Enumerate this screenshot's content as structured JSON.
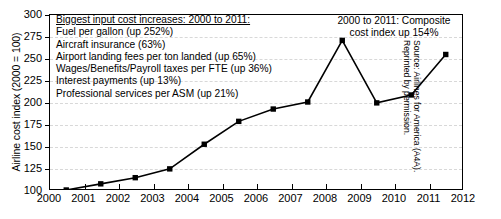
{
  "chart_data": {
    "type": "line",
    "title": "",
    "xlabel": "",
    "ylabel": "Airline cost index (2000 = 100)",
    "categories": [
      2000,
      2001,
      2002,
      2003,
      2004,
      2005,
      2006,
      2007,
      2008,
      2009,
      2010,
      2011
    ],
    "values": [
      100,
      107,
      114,
      124,
      152,
      178,
      192,
      200,
      270,
      199,
      208,
      254
    ],
    "series": [
      {
        "name": "Airline composite cost index",
        "values": [
          100,
          107,
          114,
          124,
          152,
          178,
          192,
          200,
          270,
          199,
          208,
          254
        ]
      }
    ],
    "x_tick_labels": [
      "2000",
      "2001",
      "2002",
      "2003",
      "2004",
      "2005",
      "2006",
      "2007",
      "2008",
      "2009",
      "2010",
      "2011",
      "2012"
    ],
    "y_tick_labels": [
      "100",
      "125",
      "150",
      "175",
      "200",
      "225",
      "250",
      "275",
      "300"
    ],
    "ylim": [
      100,
      300
    ],
    "xlim": [
      2000,
      2012
    ],
    "y_ticks": [
      100,
      125,
      150,
      175,
      200,
      225,
      250,
      275,
      300
    ],
    "grid": "horizontal-dashed",
    "legend": "none",
    "marker": "square",
    "line_color": "#000000",
    "marker_color": "#000000",
    "grid_color": "#d8d8d8",
    "annotations": [
      {
        "name": "cost-increase-list",
        "header": "Biggest input cost increases: 2000 to 2011:",
        "items": [
          "Fuel per gallon (up 252%)",
          "Aircraft insurance (63%)",
          "Airport landing fees per ton landed (up 65%)",
          "Wages/Benefits/Payroll taxes per FTE (up 36%)",
          "Interest payments (up 13%)",
          "Professional services per ASM (up 21%)"
        ]
      },
      {
        "name": "composite-index-note",
        "line1": "2000 to 2011: Composite",
        "line2": "cost index up 154%"
      }
    ]
  },
  "source": {
    "text": "Source: Airlines for America (A4A). Reprinted by permission."
  }
}
